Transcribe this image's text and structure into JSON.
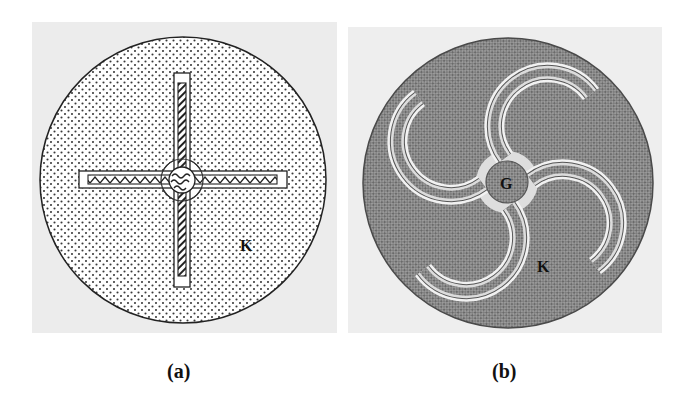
{
  "figure": {
    "panels": [
      {
        "id": "a",
        "caption": "(a)",
        "description": "Circular pad with straight cross-shaped gate fingers",
        "labels": {
          "region": "K"
        },
        "style": {
          "background": "#ececec",
          "fill": "dotted",
          "edge": "#222222"
        }
      },
      {
        "id": "b",
        "caption": "(b)",
        "description": "Circular pad with curved pinwheel gate fingers",
        "labels": {
          "center": "G",
          "region": "K"
        },
        "style": {
          "background": "#eeeeee",
          "fill": "crosshatch",
          "edge": "#444444"
        }
      }
    ]
  }
}
